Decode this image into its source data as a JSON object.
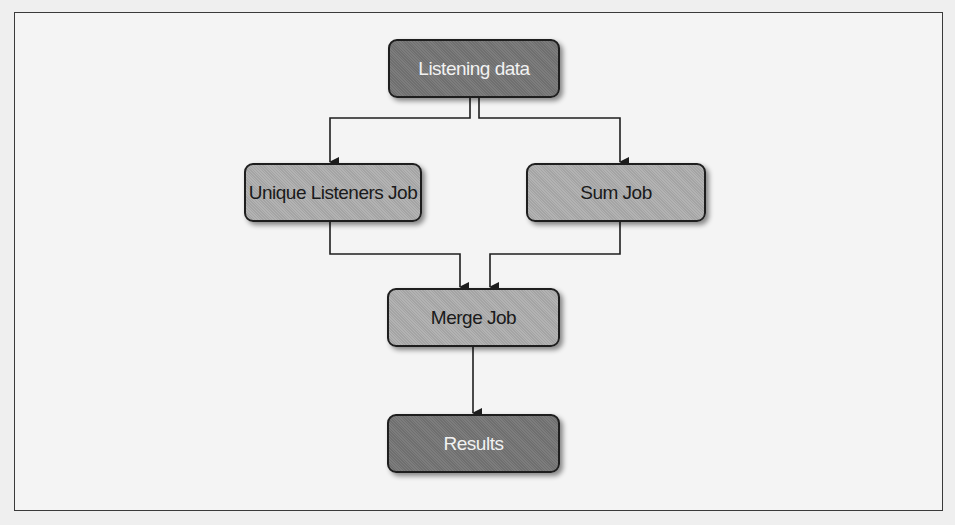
{
  "diagram": {
    "type": "flowchart",
    "nodes": [
      {
        "id": "listening",
        "label": "Listening data",
        "style": "dark"
      },
      {
        "id": "unique",
        "label": "Unique Listeners Job",
        "style": "light"
      },
      {
        "id": "sum",
        "label": "Sum Job",
        "style": "light"
      },
      {
        "id": "merge",
        "label": "Merge Job",
        "style": "light"
      },
      {
        "id": "results",
        "label": "Results",
        "style": "dark"
      }
    ],
    "edges": [
      {
        "from": "listening",
        "to": "unique"
      },
      {
        "from": "listening",
        "to": "sum"
      },
      {
        "from": "unique",
        "to": "merge"
      },
      {
        "from": "sum",
        "to": "merge"
      },
      {
        "from": "merge",
        "to": "results"
      }
    ]
  },
  "colors": {
    "dark_node": "#777777",
    "light_node": "#acacac",
    "line": "#1e1e1e",
    "background": "#efefef"
  }
}
